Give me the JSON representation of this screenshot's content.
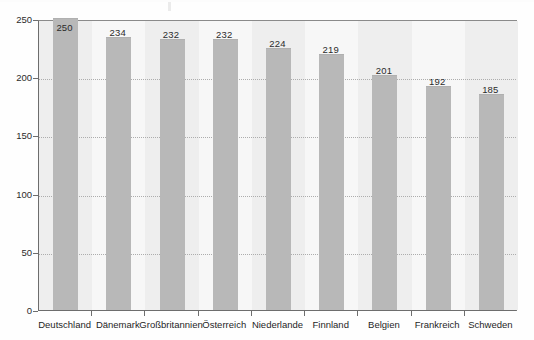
{
  "chart_data": {
    "type": "bar",
    "title": "",
    "subtitle": "",
    "xlabel": "",
    "ylabel": "",
    "categories": [
      "Deutschland",
      "Dänemark",
      "Großbritannien",
      "Österreich",
      "Niederlande",
      "Finnland",
      "Belgien",
      "Frankreich",
      "Schweden"
    ],
    "values": [
      250,
      234,
      232,
      232,
      224,
      219,
      201,
      192,
      185
    ],
    "value_labels": [
      "250",
      "234",
      "232",
      "232",
      "224",
      "219",
      "201",
      "192",
      "185"
    ],
    "ylim": [
      0,
      250
    ],
    "ytick_labels": [
      "0",
      "50",
      "100",
      "150",
      "200",
      "250"
    ],
    "ytick_values": [
      0,
      50,
      100,
      150,
      200,
      250
    ],
    "grid": true,
    "grid_style": "dotted",
    "legend": false,
    "legend_position": "none",
    "bar_color": "#b8b8b8",
    "axis_color": "#6d6d6d",
    "gridline_color": "#aaaaaa",
    "plot_background": "#f4f4f4",
    "band_color": "#eeeeee",
    "band_alt_color": "#f7f7f7",
    "label_color": "#2b2b2b"
  }
}
